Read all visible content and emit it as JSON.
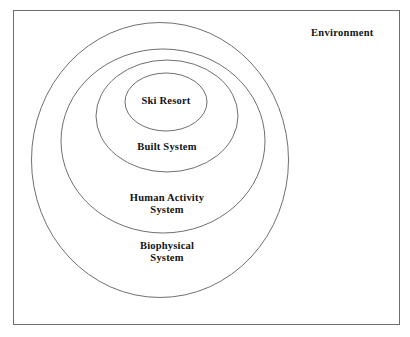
{
  "figure": {
    "type": "nested-circles-diagram",
    "background_color": "#ffffff",
    "frame": {
      "name": "diagram-border",
      "stroke_color": "#6e6e72"
    },
    "outside_label": {
      "text": "Environment"
    },
    "rings": [
      {
        "id": "ski-resort",
        "label": "Ski Resort",
        "lines": [
          "Ski Resort"
        ],
        "level": 1,
        "stroke_color": "#5f5f63"
      },
      {
        "id": "built-system",
        "label": "Built System",
        "lines": [
          "Built System"
        ],
        "level": 2,
        "stroke_color": "#5f5f63"
      },
      {
        "id": "human-activity-system",
        "label": "Human Activity System",
        "lines": [
          "Human Activity",
          "System"
        ],
        "level": 3,
        "stroke_color": "#5f5f63"
      },
      {
        "id": "biophysical-system",
        "label": "Biophysical System",
        "lines": [
          "Biophysical",
          "System"
        ],
        "level": 4,
        "stroke_color": "#5f5f63"
      }
    ]
  }
}
